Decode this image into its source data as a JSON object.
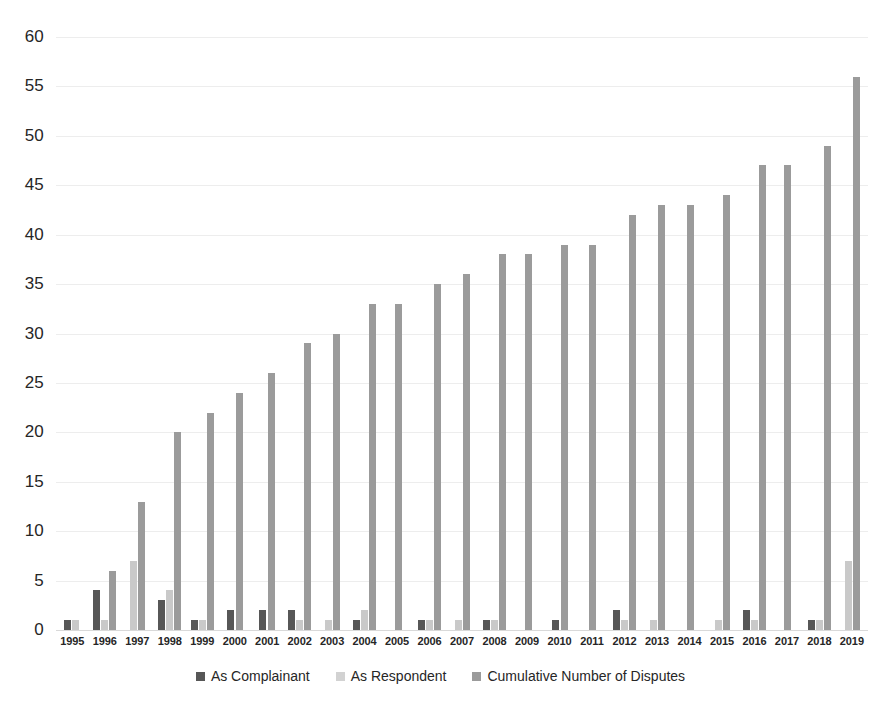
{
  "chart_data": {
    "type": "bar",
    "title": "",
    "xlabel": "",
    "ylabel": "",
    "ylim": [
      0,
      60
    ],
    "ytick_step": 5,
    "yticks": [
      0,
      5,
      10,
      15,
      20,
      25,
      30,
      35,
      40,
      45,
      50,
      55,
      60
    ],
    "grid": true,
    "legend_position": "bottom",
    "categories": [
      "1995",
      "1996",
      "1997",
      "1998",
      "1999",
      "2000",
      "2001",
      "2002",
      "2003",
      "2004",
      "2005",
      "2006",
      "2007",
      "2008",
      "2009",
      "2010",
      "2011",
      "2012",
      "2013",
      "2014",
      "2015",
      "2016",
      "2017",
      "2018",
      "2019"
    ],
    "series": [
      {
        "name": "As Complainant",
        "color": "#575757",
        "values": [
          1,
          4,
          0,
          3,
          1,
          2,
          2,
          2,
          0,
          1,
          0,
          1,
          0,
          1,
          0,
          1,
          0,
          2,
          0,
          0,
          0,
          2,
          0,
          1,
          0
        ]
      },
      {
        "name": "As Respondent",
        "color": "#d2d2d2",
        "values": [
          1,
          1,
          7,
          4,
          1,
          0,
          0,
          1,
          1,
          2,
          0,
          1,
          1,
          1,
          0,
          0,
          0,
          1,
          1,
          0,
          1,
          1,
          0,
          1,
          7
        ]
      },
      {
        "name": "Cumulative Number of Disputes",
        "color": "#9b9b9b",
        "values": [
          0,
          6,
          13,
          20,
          22,
          24,
          26,
          29,
          30,
          33,
          33,
          35,
          36,
          38,
          38,
          39,
          39,
          42,
          43,
          43,
          44,
          47,
          47,
          49,
          56
        ]
      }
    ]
  },
  "legend": {
    "items": [
      {
        "label": "As Complainant"
      },
      {
        "label": "As Respondent"
      },
      {
        "label": "Cumulative Number of Disputes"
      }
    ]
  }
}
